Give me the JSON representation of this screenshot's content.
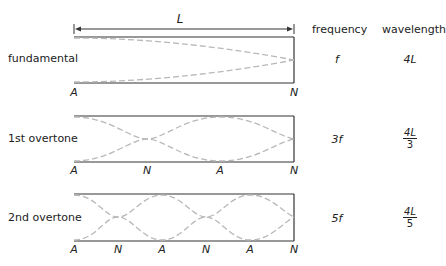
{
  "dimension": {
    "label": "L"
  },
  "headers": {
    "frequency": "frequency",
    "wavelength": "wavelength"
  },
  "modes": [
    {
      "name": "fundamental",
      "frequency": "f",
      "wavelength_num": "4L",
      "wavelength_den": "",
      "nodes": [
        "A",
        "N"
      ]
    },
    {
      "name": "1st overtone",
      "frequency": "3f",
      "wavelength_num": "4L",
      "wavelength_den": "3",
      "nodes": [
        "A",
        "N",
        "A",
        "N"
      ]
    },
    {
      "name": "2nd overtone",
      "frequency": "5f",
      "wavelength_num": "4L",
      "wavelength_den": "5",
      "nodes": [
        "A",
        "N",
        "A",
        "N",
        "A",
        "N"
      ]
    }
  ],
  "colors": {
    "tube": "#333333",
    "wave": "#b8b8b8"
  }
}
